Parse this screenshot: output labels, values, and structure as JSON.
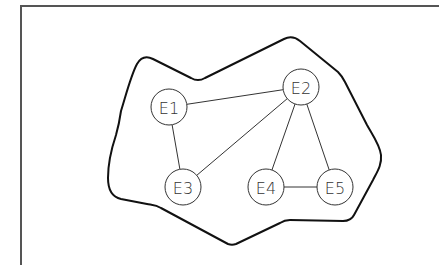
{
  "diagram": {
    "type": "graph",
    "nodes": [
      {
        "id": "E1",
        "label": "E1",
        "x": 169,
        "y": 107
      },
      {
        "id": "E2",
        "label": "E2",
        "x": 301,
        "y": 87
      },
      {
        "id": "E3",
        "label": "E3",
        "x": 183,
        "y": 187
      },
      {
        "id": "E4",
        "label": "E4",
        "x": 266,
        "y": 187
      },
      {
        "id": "E5",
        "label": "E5",
        "x": 335,
        "y": 187
      }
    ],
    "edges": [
      {
        "from": "E1",
        "to": "E2"
      },
      {
        "from": "E1",
        "to": "E3"
      },
      {
        "from": "E2",
        "to": "E3"
      },
      {
        "from": "E2",
        "to": "E4"
      },
      {
        "from": "E2",
        "to": "E5"
      },
      {
        "from": "E4",
        "to": "E5"
      }
    ],
    "boundary": "closed irregular outline enclosing all nodes"
  }
}
